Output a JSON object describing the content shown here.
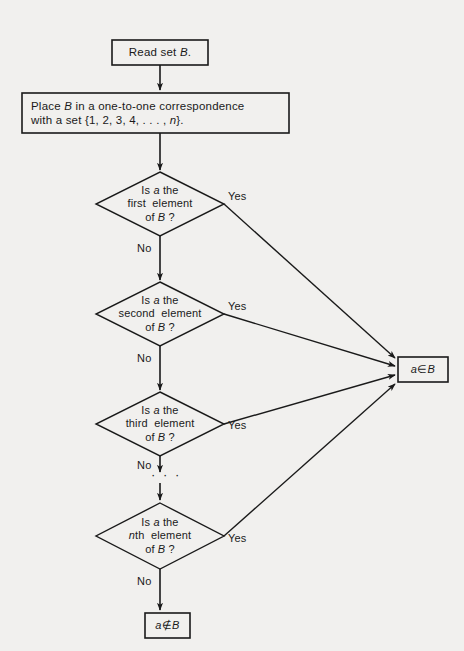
{
  "diagram": {
    "colors": {
      "background": "#f1f0ee",
      "stroke": "#1a1a1a",
      "text": "#1a1a1a",
      "shape_fill": "#f1f0ee"
    },
    "nodes": {
      "start": {
        "type": "process",
        "text_line1": "Read set ",
        "text_italic": "B",
        "text_line1_end": "."
      },
      "correspondence": {
        "type": "process",
        "line1_a": "Place ",
        "line1_italic": "B",
        "line1_b": " in a one-to-one correspondence",
        "line2_a": "with a set {1, 2, 3, 4, . . . , ",
        "line2_italic": "n",
        "line2_b": "}."
      },
      "decision1": {
        "type": "decision",
        "line1_a": "Is ",
        "line1_italic": "a",
        "line1_b": " the",
        "line2": "first  element",
        "line3_a": "of ",
        "line3_italic": "B",
        "line3_b": " ?"
      },
      "decision2": {
        "type": "decision",
        "line1_a": "Is ",
        "line1_italic": "a",
        "line1_b": " the",
        "line2": "second  element",
        "line3_a": "of ",
        "line3_italic": "B",
        "line3_b": " ?"
      },
      "decision3": {
        "type": "decision",
        "line1_a": "Is ",
        "line1_italic": "a",
        "line1_b": " the",
        "line2": "third  element",
        "line3_a": "of ",
        "line3_italic": "B",
        "line3_b": " ?"
      },
      "decision4": {
        "type": "decision",
        "line1_a": "Is ",
        "line1_italic": "a",
        "line1_b": " the",
        "line2_italic": "n",
        "line2_b": "th  element",
        "line3_a": "of ",
        "line3_italic": "B",
        "line3_b": " ?"
      },
      "terminal_member": {
        "type": "terminal",
        "italic_a": "a",
        "symbol": "∈",
        "italic_b": "B"
      },
      "terminal_not_member": {
        "type": "terminal",
        "italic_a": "a",
        "symbol": "∉",
        "italic_b": "B"
      },
      "ellipsis": {
        "type": "continuation",
        "text": "· · ·"
      }
    },
    "edge_labels": {
      "yes1": "Yes",
      "yes2": "Yes",
      "yes3": "Yes",
      "yes4": "Yes",
      "no1": "No",
      "no2": "No",
      "no3": "No",
      "no4": "No"
    }
  }
}
